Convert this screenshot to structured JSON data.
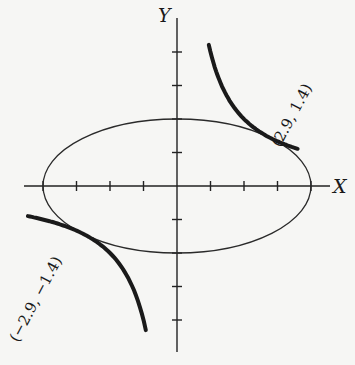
{
  "chart_data": {
    "type": "line",
    "title": "",
    "xlabel": "X",
    "ylabel": "Y",
    "grid": false,
    "axis_range": {
      "x": [
        -4.5,
        4.6
      ],
      "y": [
        -5,
        5
      ]
    },
    "ticks": {
      "x": [
        -4,
        -3,
        -2,
        -1,
        1,
        2,
        3,
        4
      ],
      "y": [
        -4,
        -3,
        -2,
        -1,
        1,
        2,
        3,
        4
      ]
    },
    "series": [
      {
        "name": "ellipse",
        "equation": "x^2/16 + y^2/4 = 1",
        "a": 4,
        "b": 2,
        "stroke": "thin"
      },
      {
        "name": "hyperbola-branch-upper",
        "equation": "xy = 4",
        "x_range": [
          0.95,
          3.6
        ],
        "stroke": "bold"
      },
      {
        "name": "hyperbola-branch-lower",
        "equation": "xy = 4",
        "x_range": [
          -4.45,
          -0.93
        ],
        "stroke": "bold"
      }
    ],
    "annotations": [
      {
        "text": "(2.9, 1.4)",
        "x": 2.9,
        "y": 1.4
      },
      {
        "text": "(−2.9, −1.4)",
        "x": -2.9,
        "y": -1.4
      }
    ]
  },
  "labels": {
    "x_axis": "X",
    "y_axis": "Y",
    "point_upper": "(2.9, 1.4)",
    "point_lower": "(−2.9, −1.4)"
  }
}
